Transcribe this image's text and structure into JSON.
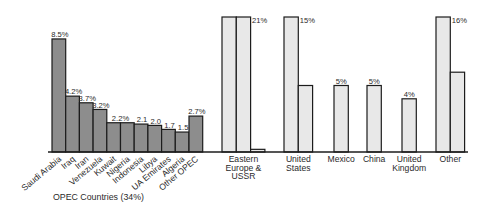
{
  "chart_data": {
    "type": "bar",
    "title": "",
    "xlabel": "",
    "ylabel": "",
    "unit": "%",
    "grid": false,
    "legend": "none",
    "opec": {
      "group_label": "OPEC Countries (34%)",
      "fill": "#8d8d8d",
      "categories": [
        "Saudi Arabia",
        "Iraq",
        "Iran",
        "Venezuela",
        "Kuwait",
        "Nigeria",
        "Indonesia",
        "Libya",
        "UA Emirates",
        "Algeria",
        "Other OPEC"
      ],
      "values": [
        8.5,
        4.2,
        3.7,
        3.2,
        2.2,
        2.2,
        2.1,
        2.0,
        1.7,
        1.5,
        2.7
      ],
      "value_labels": [
        "8.5%",
        "4.2%",
        "3.7%",
        "3.2%",
        "2.2%",
        "",
        "2.1",
        "2.0",
        "1.7",
        "1.5",
        "2.7%"
      ]
    },
    "non_opec": {
      "fill": "#e8e8e8",
      "categories": [
        "Eastern Europe & USSR",
        "United States",
        "Mexico",
        "China",
        "United Kingdom",
        "Other"
      ],
      "label_lines": [
        [
          "Eastern",
          "Europe &",
          "USSR"
        ],
        [
          "United",
          "States"
        ],
        [
          "Mexico"
        ],
        [
          "China"
        ],
        [
          "United",
          "Kingdom"
        ],
        [
          "Other"
        ]
      ],
      "values": [
        21,
        15,
        5,
        5,
        4,
        16
      ],
      "value_labels": [
        "21%",
        "15%",
        "5%",
        "5%",
        "4%",
        "16%"
      ],
      "bar_segments": [
        [
          10.15,
          10.15,
          0.2
        ],
        [
          10.15,
          5
        ],
        [
          5
        ],
        [
          5
        ],
        [
          4
        ],
        [
          10.15,
          6
        ]
      ]
    }
  }
}
